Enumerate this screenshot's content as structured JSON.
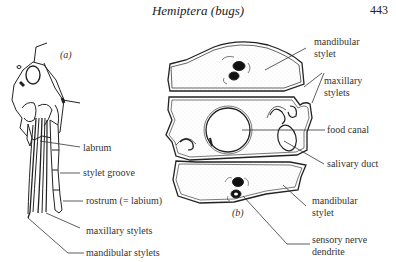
{
  "header": {
    "running_title": "Hemiptera (bugs)",
    "page_number": "443"
  },
  "figure": {
    "panel_a": {
      "panel_label": "(a)",
      "labels": {
        "labrum": "labrum",
        "stylet_groove": "stylet groove",
        "rostrum": "rostrum (= labium)",
        "maxillary_stylets": "maxillary stylets",
        "mandibular_stylets": "mandibular stylets"
      }
    },
    "panel_b": {
      "panel_label": "(b)",
      "labels": {
        "mandibular_stylet_top_1": "mandibular",
        "mandibular_stylet_top_2": "stylet",
        "maxillary_stylets_1": "maxillary",
        "maxillary_stylets_2": "stylets",
        "food_canal": "food canal",
        "salivary_duct": "salivary duct",
        "mandibular_stylet_bottom_1": "mandibular",
        "mandibular_stylet_bottom_2": "stylet",
        "sensory_nerve_1": "sensory nerve",
        "sensory_nerve_2": "dendrite"
      }
    }
  }
}
